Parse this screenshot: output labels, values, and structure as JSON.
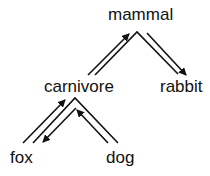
{
  "diagram": {
    "type": "tree",
    "nodes": [
      {
        "id": "mammal",
        "label": "mammal",
        "x": 108,
        "y": 6
      },
      {
        "id": "carnivore",
        "label": "carnivore",
        "x": 44,
        "y": 78
      },
      {
        "id": "rabbit",
        "label": "rabbit",
        "x": 160,
        "y": 78
      },
      {
        "id": "fox",
        "label": "fox",
        "x": 10,
        "y": 149
      },
      {
        "id": "dog",
        "label": "dog",
        "x": 106,
        "y": 149
      }
    ],
    "edges": [
      {
        "from": "carnivore",
        "to": "mammal",
        "direction": "up"
      },
      {
        "from": "mammal",
        "to": "rabbit",
        "direction": "down"
      },
      {
        "from": "fox",
        "to": "carnivore",
        "direction": "up"
      },
      {
        "from": "carnivore",
        "to": "fox",
        "direction": "down"
      },
      {
        "from": "dog",
        "to": "carnivore",
        "direction": "up"
      }
    ],
    "colors": {
      "line": "#111111",
      "text": "#111111",
      "background": "#ffffff"
    }
  }
}
